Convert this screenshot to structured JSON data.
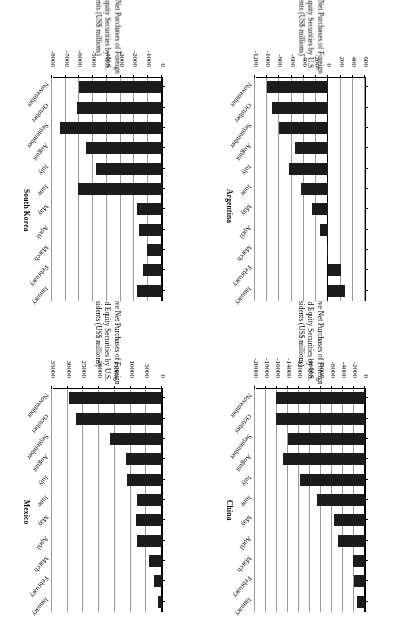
{
  "figure": {
    "orientation_note": "upside-down-scan",
    "categories": [
      "January",
      "February",
      "March",
      "April",
      "May",
      "June",
      "July",
      "August",
      "September",
      "October",
      "November"
    ],
    "value_axis_title": "Cumulative Net Purchases of Foreign\nDebt and Equity Securities by U.S.\nResidents (US$ millions)"
  },
  "chart_data": [
    {
      "type": "bar",
      "title": "China",
      "orientation": "horizontal",
      "xlabel": "Cumulative Net Purchases of Foreign Debt and Equity Securities by U.S. Residents (US$ millions)",
      "ylabel": "",
      "categories": [
        "January",
        "February",
        "March",
        "April",
        "May",
        "June",
        "July",
        "August",
        "September",
        "October",
        "November"
      ],
      "values": [
        -1400,
        -2000,
        -2100,
        -4900,
        -5600,
        -8800,
        -11800,
        -14900,
        -14000,
        -16200,
        -16100
      ],
      "xlim": [
        0,
        -20000
      ],
      "ticks": [
        0,
        -2000,
        -4000,
        -6000,
        -8000,
        -10000,
        -12000,
        -14000,
        -16000,
        -18000,
        -20000
      ],
      "tick_labels": [
        "0",
        "-2000",
        "-4000",
        "-6000",
        "-8000",
        "-10000",
        "-12000",
        "-14000",
        "-16000",
        "-18000",
        "-20000"
      ],
      "grid": true,
      "legend": "none",
      "bar_color": "#1c1c1c"
    },
    {
      "type": "bar",
      "title": "Mexico",
      "orientation": "horizontal",
      "xlabel": "Cumulative Net Purchases of Foreign Debt and Equity Securities by U.S. Residents (US$ millions)",
      "ylabel": "",
      "categories": [
        "January",
        "February",
        "March",
        "April",
        "May",
        "June",
        "July",
        "August",
        "September",
        "October",
        "November"
      ],
      "values": [
        1300,
        2700,
        4100,
        8100,
        8200,
        8100,
        11200,
        11400,
        16700,
        27300,
        29600
      ],
      "xlim": [
        0,
        35000
      ],
      "ticks": [
        0,
        5000,
        10000,
        15000,
        20000,
        25000,
        30000,
        35000
      ],
      "tick_labels": [
        "0",
        "5000",
        "10000",
        "15000",
        "20000",
        "25000",
        "30000",
        "35000"
      ],
      "grid": true,
      "legend": "none",
      "bar_color": "#1c1c1c"
    },
    {
      "type": "bar",
      "title": "Argentina",
      "orientation": "horizontal",
      "xlabel": "Cumulative Net Purchases of Foreign Debt and Equity Securities by U.S. Residents (US$ millions)",
      "ylabel": "",
      "categories": [
        "January",
        "February",
        "March",
        "April",
        "May",
        "June",
        "July",
        "August",
        "September",
        "October",
        "November"
      ],
      "values": [
        280,
        215,
        -15,
        -130,
        -260,
        -440,
        -640,
        -540,
        -800,
        -930,
        -1000
      ],
      "xlim": [
        600,
        -1200
      ],
      "ticks": [
        600,
        400,
        200,
        0,
        -200,
        -400,
        -600,
        -800,
        -1000,
        -1200
      ],
      "tick_labels": [
        "600",
        "400",
        "200",
        "0",
        "-200",
        "-400",
        "-600",
        "-800",
        "-1000",
        "-1200"
      ],
      "grid": true,
      "legend": "none",
      "bar_color": "#1c1c1c"
    },
    {
      "type": "bar",
      "title": "South Korea",
      "orientation": "horizontal",
      "xlabel": "Cumulative Net Purchases of Foreign Debt and Equity Securities by U.S. Residents (US$ millions)",
      "ylabel": "",
      "categories": [
        "January",
        "February",
        "March",
        "April",
        "May",
        "June",
        "July",
        "August",
        "September",
        "October",
        "November"
      ],
      "values": [
        -1800,
        -1400,
        -1100,
        -1700,
        -1800,
        -6100,
        -4800,
        -5500,
        -7400,
        -6200,
        -6000
      ],
      "xlim": [
        0,
        -8000
      ],
      "ticks": [
        0,
        -1000,
        -2000,
        -3000,
        -4000,
        -5000,
        -6000,
        -7000,
        -8000
      ],
      "tick_labels": [
        "0",
        "-1000",
        "-2000",
        "-3000",
        "-4000",
        "-5000",
        "-6000",
        "-7000",
        "-8000"
      ],
      "grid": true,
      "legend": "none",
      "bar_color": "#1c1c1c"
    }
  ]
}
